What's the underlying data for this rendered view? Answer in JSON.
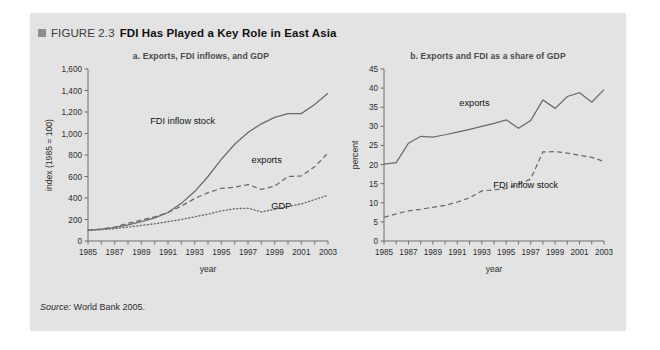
{
  "figure": {
    "bullet_icon": "square-bullet-icon",
    "number": "FIGURE 2.3",
    "title": "FDI Has Played a Key Role in East Asia",
    "source_label": "Source:",
    "source_text": "World Bank 2005."
  },
  "panel": {
    "background_color": "#e3e3e3",
    "ink_color": "#6a6a6a"
  },
  "chart_data": [
    {
      "type": "line",
      "id": "chart-a",
      "title": "a. Exports, FDI inflows, and GDP",
      "xlabel": "year",
      "ylabel": "index (1985 = 100)",
      "xlim": [
        1985,
        2003
      ],
      "ylim": [
        0,
        1600
      ],
      "yticks": [
        0,
        200,
        400,
        600,
        800,
        1000,
        1200,
        1400,
        1600
      ],
      "ytick_labels": [
        "0",
        "200",
        "400",
        "600",
        "800",
        "1,000",
        "1,200",
        "1,400",
        "1,600"
      ],
      "xticks": [
        1985,
        1986,
        1987,
        1988,
        1989,
        1990,
        1991,
        1992,
        1993,
        1994,
        1995,
        1996,
        1997,
        1998,
        1999,
        2000,
        2001,
        2002,
        2003
      ],
      "xtick_labels": [
        "1985",
        "1987",
        "1989",
        "1991",
        "1993",
        "1995",
        "1997",
        "1999",
        "2001",
        "2003"
      ],
      "xtick_label_years": [
        1985,
        1987,
        1989,
        1991,
        1993,
        1995,
        1997,
        1999,
        2001,
        2003
      ],
      "grid": false,
      "legend_position": "inline-annotations",
      "x": [
        1985,
        1986,
        1987,
        1988,
        1989,
        1990,
        1991,
        1992,
        1993,
        1994,
        1995,
        1996,
        1997,
        1998,
        1999,
        2000,
        2001,
        2002,
        2003
      ],
      "series": [
        {
          "name": "FDI inflow stock",
          "style": "solid",
          "label_x": 1992.1,
          "label_y": 1090,
          "values": [
            100,
            110,
            125,
            150,
            180,
            215,
            265,
            350,
            460,
            600,
            760,
            900,
            1010,
            1090,
            1150,
            1185,
            1185,
            1270,
            1375
          ]
        },
        {
          "name": "exports",
          "style": "dashed",
          "label_x": 1998.4,
          "label_y": 730,
          "values": [
            100,
            110,
            130,
            165,
            195,
            225,
            265,
            325,
            395,
            450,
            490,
            500,
            525,
            480,
            510,
            600,
            605,
            690,
            820
          ]
        },
        {
          "name": "GDP",
          "style": "dotted",
          "label_x": 1999.5,
          "label_y": 295,
          "values": [
            100,
            105,
            115,
            130,
            145,
            160,
            180,
            200,
            225,
            250,
            280,
            300,
            305,
            270,
            295,
            320,
            345,
            385,
            425
          ]
        }
      ]
    },
    {
      "type": "line",
      "id": "chart-b",
      "title": "b. Exports and FDI as a share of GDP",
      "xlabel": "year",
      "ylabel": "percent",
      "xlim": [
        1985,
        2003
      ],
      "ylim": [
        0,
        45
      ],
      "yticks": [
        0,
        5,
        10,
        15,
        20,
        25,
        30,
        35,
        40,
        45
      ],
      "ytick_labels": [
        "0",
        "5",
        "10",
        "15",
        "20",
        "25",
        "30",
        "35",
        "40",
        "45"
      ],
      "xticks": [
        1985,
        1986,
        1987,
        1988,
        1989,
        1990,
        1991,
        1992,
        1993,
        1994,
        1995,
        1996,
        1997,
        1998,
        1999,
        2000,
        2001,
        2002,
        2003
      ],
      "xtick_labels": [
        "1985",
        "1987",
        "1989",
        "1991",
        "1993",
        "1995",
        "1997",
        "1999",
        "2001",
        "2003"
      ],
      "xtick_label_years": [
        1985,
        1987,
        1989,
        1991,
        1993,
        1995,
        1997,
        1999,
        2001,
        2003
      ],
      "grid": false,
      "legend_position": "inline-annotations",
      "x": [
        1985,
        1986,
        1987,
        1988,
        1989,
        1990,
        1991,
        1992,
        1993,
        1994,
        1995,
        1996,
        1997,
        1998,
        1999,
        2000,
        2001,
        2002,
        2003
      ],
      "series": [
        {
          "name": "exports",
          "style": "solid",
          "label_x": 1992.4,
          "label_y": 35.2,
          "values": [
            20.1,
            20.5,
            25.6,
            27.4,
            27.2,
            27.8,
            28.5,
            29.2,
            30.0,
            30.8,
            31.7,
            29.5,
            31.5,
            36.9,
            34.7,
            37.8,
            38.8,
            36.3,
            39.6
          ]
        },
        {
          "name": "FDI inflow stock",
          "style": "dashed",
          "label_x": 1996.6,
          "label_y": 13.8,
          "values": [
            6.2,
            7.1,
            7.9,
            8.3,
            8.8,
            9.3,
            10.2,
            11.3,
            13.1,
            13.4,
            13.7,
            14.8,
            16.2,
            23.3,
            23.4,
            23.0,
            22.4,
            21.9,
            20.8
          ]
        }
      ]
    }
  ]
}
